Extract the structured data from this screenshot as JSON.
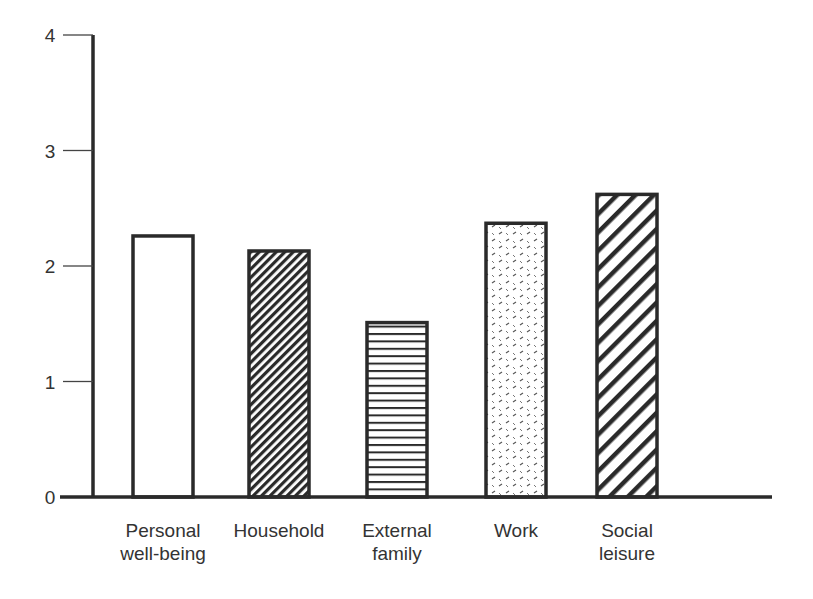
{
  "chart_data": {
    "type": "bar",
    "title": "",
    "xlabel": "",
    "ylabel": "",
    "ylim": [
      0,
      4
    ],
    "yticks": [
      0,
      1,
      2,
      3,
      4
    ],
    "grid": false,
    "legend": null,
    "categories": [
      "Personal well-being",
      "Household",
      "External family",
      "Work",
      "Social leisure"
    ],
    "category_lines": [
      [
        "Personal",
        "well-being"
      ],
      [
        "Household"
      ],
      [
        "External",
        "family"
      ],
      [
        "Work"
      ],
      [
        "Social",
        "leisure"
      ]
    ],
    "values": [
      2.26,
      2.13,
      1.51,
      2.37,
      2.62
    ],
    "fills": [
      "blank",
      "fine-diagonal-dense",
      "horizontal-lines",
      "dotted-dashes",
      "bold-diagonal"
    ]
  },
  "colors": {
    "ink": "#2a2a2a",
    "text": "#333333",
    "background": "#ffffff"
  }
}
